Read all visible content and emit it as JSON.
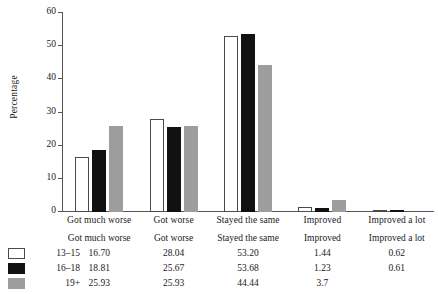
{
  "chart_data": {
    "type": "bar",
    "title": "",
    "xlabel": "",
    "ylabel": "Percentage",
    "ylim": [
      0,
      60
    ],
    "yticks": [
      0,
      10,
      20,
      30,
      40,
      50,
      60
    ],
    "grid": false,
    "legend_position": "bottom-left",
    "categories": [
      "Got much worse",
      "Got worse",
      "Stayed the same",
      "Improved",
      "Improved a lot"
    ],
    "series": [
      {
        "name": "13–15",
        "color": "#ffffff",
        "edge_color": "#4a4a4a",
        "values": [
          16.7,
          28.04,
          53.2,
          1.44,
          0.62
        ],
        "value_labels": [
          "16.70",
          "28.04",
          "53.20",
          "1.44",
          "0.62"
        ]
      },
      {
        "name": "16–18",
        "color": "#111111",
        "edge_color": "#111111",
        "values": [
          18.81,
          25.67,
          53.68,
          1.23,
          0.61
        ],
        "value_labels": [
          "18.81",
          "25.67",
          "53.68",
          "1.23",
          "0.61"
        ]
      },
      {
        "name": "19+",
        "color": "#9d9d9d",
        "edge_color": "#9d9d9d",
        "values": [
          25.93,
          25.93,
          44.44,
          3.7,
          null
        ],
        "value_labels": [
          "25.93",
          "25.93",
          "44.44",
          "3.7",
          ""
        ]
      }
    ]
  },
  "axis": {
    "y_label": "Percentage",
    "y_tick_labels": [
      "60",
      "50",
      "40",
      "30",
      "20",
      "10",
      "0"
    ]
  },
  "legend": {
    "items": [
      {
        "label": "13–15",
        "swatch": "swatch-white-outlined"
      },
      {
        "label": "16–18",
        "swatch": "swatch-black"
      },
      {
        "label": "19+",
        "swatch": "swatch-gray"
      }
    ]
  },
  "table": {
    "column_headers": [
      "Got much worse",
      "Got worse",
      "Stayed the same",
      "Improved",
      "Improved a lot"
    ],
    "rows": [
      {
        "group": "13–15",
        "values": [
          "16.70",
          "28.04",
          "53.20",
          "1.44",
          "0.62"
        ]
      },
      {
        "group": "16–18",
        "values": [
          "18.81",
          "25.67",
          "53.68",
          "1.23",
          "0.61"
        ]
      },
      {
        "group": "19+",
        "values": [
          "25.93",
          "25.93",
          "44.44",
          "3.7",
          ""
        ]
      }
    ]
  }
}
